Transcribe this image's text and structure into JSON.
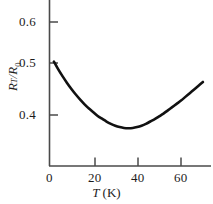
{
  "chart_data": {
    "type": "line",
    "title": "",
    "subtitle": "",
    "xlabel": "T (K)",
    "ylabel": "R_T/R_0",
    "xlabel_parts": {
      "symbol": "T",
      "unit": "(K)"
    },
    "ylabel_parts": {
      "numerator": "R",
      "numerator_sub": "T",
      "denominator": "R",
      "denominator_sub": "0"
    },
    "xlim": [
      0,
      70
    ],
    "ylim": [
      0.3,
      0.63
    ],
    "xticks": [
      0,
      20,
      40,
      60
    ],
    "xtick_labels": [
      "0",
      "20",
      "40",
      "60"
    ],
    "yticks": [
      0.4,
      0.5,
      0.6
    ],
    "ytick_labels": [
      "0.4",
      "0.5",
      "0.6"
    ],
    "grid": false,
    "legend": "none",
    "series": [
      {
        "name": "R_T/R_0",
        "color": "#111111",
        "linewidth": 2.6,
        "x": [
          2,
          4,
          6,
          8,
          10,
          12,
          14,
          16,
          18,
          20,
          22,
          24,
          26,
          28,
          30,
          32,
          34,
          36,
          38,
          40,
          42,
          44,
          46,
          48,
          50,
          52,
          54,
          56,
          58,
          60,
          62,
          64,
          66,
          68,
          70
        ],
        "y": [
          0.515,
          0.498,
          0.483,
          0.469,
          0.456,
          0.444,
          0.433,
          0.423,
          0.414,
          0.406,
          0.398,
          0.392,
          0.386,
          0.381,
          0.377,
          0.374,
          0.372,
          0.3715,
          0.372,
          0.374,
          0.377,
          0.381,
          0.386,
          0.391,
          0.397,
          0.403,
          0.41,
          0.417,
          0.424,
          0.431,
          0.439,
          0.447,
          0.455,
          0.463,
          0.471
        ]
      }
    ],
    "annotations": [],
    "minimum_point": {
      "x": 36,
      "y": 0.3715
    },
    "axis_color": "#4a4a4a"
  },
  "axes": {
    "x_tick_label_0": "0",
    "x_tick_label_1": "20",
    "x_tick_label_2": "40",
    "x_tick_label_3": "60",
    "y_tick_label_0": "0.4",
    "y_tick_label_1": "0.5",
    "y_tick_label_2": "0.6"
  }
}
